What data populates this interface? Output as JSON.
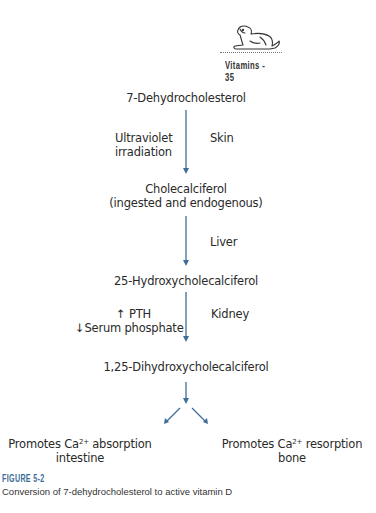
{
  "header": {
    "section": "Vitamins",
    "separator": "-",
    "page_number": "35",
    "running_head": "Vitamins - 35",
    "icon": "dog-illustration-icon"
  },
  "diagram": {
    "arrow_color": "#3d6d98",
    "nodes": [
      {
        "id": "n1",
        "label": "7-Dehydrocholesterol"
      },
      {
        "id": "n2",
        "label": "Cholecalciferol",
        "sublabel": "(ingested and endogenous)"
      },
      {
        "id": "n3",
        "label": "25-Hydroxycholecalciferol"
      },
      {
        "id": "n4",
        "label": "1,25-Dihydroxycholecalciferol"
      },
      {
        "id": "n5",
        "label_pre": "Promotes Ca",
        "sup": "2+",
        "label_post": " absorption",
        "sublabel": "intestine"
      },
      {
        "id": "n6",
        "label_pre": "Promotes Ca",
        "sup": "2+",
        "label_post": " resorption",
        "sublabel": "bone"
      }
    ],
    "edges": [
      {
        "from": "n1",
        "to": "n2",
        "left_label_1": "Ultraviolet",
        "left_label_2": "irradiation",
        "right_label": "Skin"
      },
      {
        "from": "n2",
        "to": "n3",
        "right_label": "Liver"
      },
      {
        "from": "n3",
        "to": "n4",
        "left_label_1": "↑ PTH",
        "left_label_2": "↓Serum phosphate",
        "right_label": "Kidney"
      },
      {
        "from": "n4",
        "to": "n5"
      },
      {
        "from": "n4",
        "to": "n6"
      }
    ]
  },
  "figure": {
    "label": "FIGURE 5-2",
    "caption": "Conversion of 7-dehydrocholesterol to active vitamin D"
  }
}
